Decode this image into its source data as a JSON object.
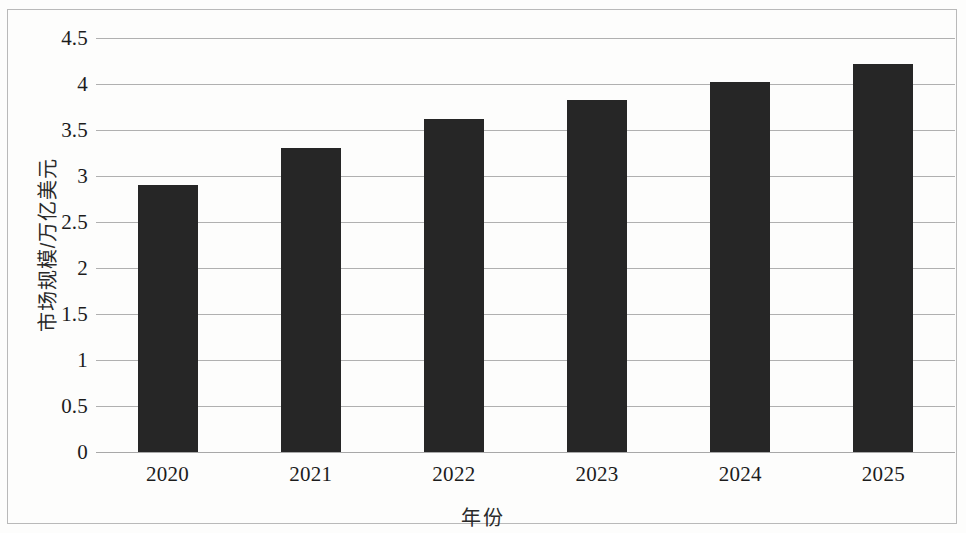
{
  "chart_data": {
    "type": "bar",
    "title": "",
    "subtitle": "",
    "xlabel": "年份",
    "ylabel": "市场规模/万亿美元",
    "categories": [
      "2020",
      "2021",
      "2022",
      "2023",
      "2024",
      "2025"
    ],
    "values": [
      2.9,
      3.3,
      3.62,
      3.83,
      4.02,
      4.22
    ],
    "series": [
      {
        "name": "市场规模",
        "values": [
          2.9,
          3.3,
          3.62,
          3.83,
          4.02,
          4.22
        ]
      }
    ],
    "ylim": [
      0,
      4.5
    ],
    "ytick_values": [
      0,
      0.5,
      1,
      1.5,
      2,
      2.5,
      3,
      3.5,
      4,
      4.5
    ],
    "ytick_labels": [
      "0",
      "0.5",
      "1",
      "1.5",
      "2",
      "2.5",
      "3",
      "3.5",
      "4",
      "4.5"
    ],
    "xtick_labels": [
      "2020",
      "2021",
      "2022",
      "2023",
      "2024",
      "2025"
    ],
    "grid": true,
    "grid_axis": "y",
    "legend": false,
    "legend_position": "none",
    "bar_color": "#262626",
    "gridline_color": "#b0b0b0",
    "axis_text_color": "#1c1c1c",
    "background_color": "#fdfdfc",
    "frame_color": "#b9b9b9",
    "data_labels": false,
    "annotations": []
  },
  "figure": {
    "border_visible": true,
    "width": 966,
    "height": 533
  }
}
